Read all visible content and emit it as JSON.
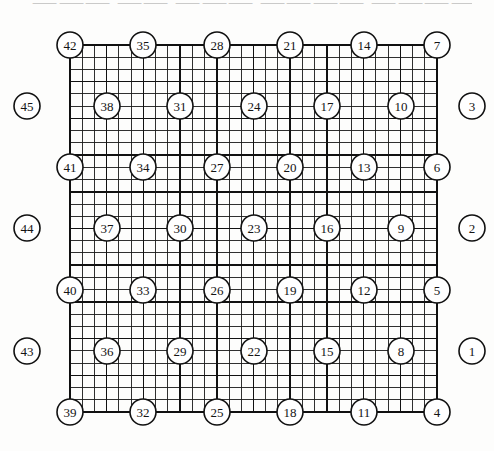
{
  "figure": {
    "scan_artifact_text": "⸺⸺⸺ ⸺⸺ ⸺⸺⸺  ⸺⸺⸺⸺ ⸺⸺⸺⸺⸺ ⸺⸺⸺ ⸺⸺⸺ ⸺⸺  ⸺"
  },
  "grid": {
    "left": 70,
    "top": 45,
    "right": 437,
    "bottom": 412,
    "columns_fine": 30,
    "rows_fine": 30,
    "fine_cell_width": 12.233,
    "fine_cell_height": 12.233,
    "major_every": 3,
    "node_spacing_cells": 6,
    "fine_line_color": "#1a1a1a",
    "fine_line_width": 0.9,
    "major_line_color": "#111111",
    "major_line_width": 1.5,
    "border_line_width": 1.8
  },
  "style": {
    "circle_radius": 13,
    "circle_fill": "#ffffff",
    "circle_stroke": "#111111",
    "circle_stroke_width": 1.6,
    "label_color": "#141414",
    "background": "#fdfdfc"
  },
  "lattice_nodes": {
    "description": "45 numbered circles. 36 sit on the 6x6 lattice of grid intersections; 9 more sit outside the left and right grid edges.",
    "rows": [
      {
        "row_index": 0,
        "y": 45,
        "position": "top-edge",
        "circles": [
          {
            "label": "42",
            "x": 70,
            "y": 45,
            "on_grid": true
          },
          {
            "label": "35",
            "x": 143,
            "y": 45,
            "on_grid": true
          },
          {
            "label": "28",
            "x": 217,
            "y": 45,
            "on_grid": true
          },
          {
            "label": "21",
            "x": 290,
            "y": 45,
            "on_grid": true
          },
          {
            "label": "14",
            "x": 364,
            "y": 45,
            "on_grid": true
          },
          {
            "label": "7",
            "x": 437,
            "y": 45,
            "on_grid": true
          }
        ]
      },
      {
        "row_index": 1,
        "y": 106,
        "position": "interior",
        "circles": [
          {
            "label": "45",
            "x": 27,
            "y": 106,
            "on_grid": false
          },
          {
            "label": "38",
            "x": 107,
            "y": 106,
            "on_grid": true
          },
          {
            "label": "31",
            "x": 180,
            "y": 106,
            "on_grid": true
          },
          {
            "label": "24",
            "x": 254,
            "y": 106,
            "on_grid": true
          },
          {
            "label": "17",
            "x": 327,
            "y": 106,
            "on_grid": true
          },
          {
            "label": "10",
            "x": 401,
            "y": 106,
            "on_grid": true
          },
          {
            "label": "3",
            "x": 472,
            "y": 106,
            "on_grid": false
          }
        ]
      },
      {
        "row_index": 2,
        "y": 167,
        "position": "interior",
        "circles": [
          {
            "label": "41",
            "x": 70,
            "y": 167,
            "on_grid": true
          },
          {
            "label": "34",
            "x": 143,
            "y": 167,
            "on_grid": true
          },
          {
            "label": "27",
            "x": 217,
            "y": 167,
            "on_grid": true
          },
          {
            "label": "20",
            "x": 290,
            "y": 167,
            "on_grid": true
          },
          {
            "label": "13",
            "x": 364,
            "y": 167,
            "on_grid": true
          },
          {
            "label": "6",
            "x": 437,
            "y": 167,
            "on_grid": true
          }
        ]
      },
      {
        "row_index": 3,
        "y": 228,
        "position": "interior",
        "circles": [
          {
            "label": "44",
            "x": 27,
            "y": 228,
            "on_grid": false
          },
          {
            "label": "37",
            "x": 107,
            "y": 228,
            "on_grid": true
          },
          {
            "label": "30",
            "x": 180,
            "y": 228,
            "on_grid": true
          },
          {
            "label": "23",
            "x": 254,
            "y": 228,
            "on_grid": true
          },
          {
            "label": "16",
            "x": 327,
            "y": 228,
            "on_grid": true
          },
          {
            "label": "9",
            "x": 401,
            "y": 228,
            "on_grid": true
          },
          {
            "label": "2",
            "x": 472,
            "y": 228,
            "on_grid": false
          }
        ]
      },
      {
        "row_index": 4,
        "y": 290,
        "position": "interior",
        "circles": [
          {
            "label": "40",
            "x": 70,
            "y": 290,
            "on_grid": true
          },
          {
            "label": "33",
            "x": 143,
            "y": 290,
            "on_grid": true
          },
          {
            "label": "26",
            "x": 217,
            "y": 290,
            "on_grid": true
          },
          {
            "label": "19",
            "x": 290,
            "y": 290,
            "on_grid": true
          },
          {
            "label": "12",
            "x": 364,
            "y": 290,
            "on_grid": true
          },
          {
            "label": "5",
            "x": 437,
            "y": 290,
            "on_grid": true
          }
        ]
      },
      {
        "row_index": 5,
        "y": 351,
        "position": "interior",
        "circles": [
          {
            "label": "43",
            "x": 27,
            "y": 351,
            "on_grid": false
          },
          {
            "label": "36",
            "x": 107,
            "y": 351,
            "on_grid": true
          },
          {
            "label": "29",
            "x": 180,
            "y": 351,
            "on_grid": true
          },
          {
            "label": "22",
            "x": 254,
            "y": 351,
            "on_grid": true
          },
          {
            "label": "15",
            "x": 327,
            "y": 351,
            "on_grid": true
          },
          {
            "label": "8",
            "x": 401,
            "y": 351,
            "on_grid": true
          },
          {
            "label": "1",
            "x": 472,
            "y": 351,
            "on_grid": false
          }
        ]
      },
      {
        "row_index": 6,
        "y": 412,
        "position": "bottom-edge",
        "circles": [
          {
            "label": "39",
            "x": 70,
            "y": 412,
            "on_grid": true
          },
          {
            "label": "32",
            "x": 143,
            "y": 412,
            "on_grid": true
          },
          {
            "label": "25",
            "x": 217,
            "y": 412,
            "on_grid": true
          },
          {
            "label": "18",
            "x": 290,
            "y": 412,
            "on_grid": true
          },
          {
            "label": "11",
            "x": 364,
            "y": 412,
            "on_grid": true
          },
          {
            "label": "4",
            "x": 437,
            "y": 412,
            "on_grid": true
          }
        ]
      }
    ]
  }
}
